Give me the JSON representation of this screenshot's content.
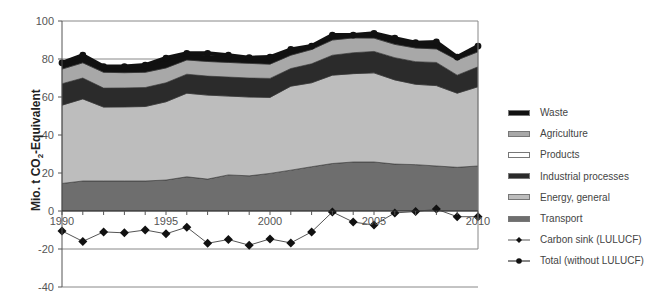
{
  "chart_data": {
    "type": "area",
    "title": "",
    "xlabel": "",
    "ylabel": "Mio. t CO2-Equivalent",
    "ylim": [
      -40,
      100
    ],
    "yticks": [
      -40,
      -20,
      0,
      20,
      40,
      60,
      80,
      100
    ],
    "xticks_labeled": [
      "1990",
      "1995",
      "2000",
      "2005",
      "2010"
    ],
    "x": [
      1990,
      1991,
      1992,
      1993,
      1994,
      1995,
      1996,
      1997,
      1998,
      1999,
      2000,
      2001,
      2002,
      2003,
      2004,
      2005,
      2006,
      2007,
      2008,
      2009,
      2010
    ],
    "grid": "horizontal lines at 80 and -20",
    "legend_position": "right",
    "stacked_series": [
      {
        "name": "Transport",
        "color": "#6e6e6e",
        "values": [
          14.5,
          15.8,
          15.8,
          15.8,
          15.8,
          16.3,
          18.0,
          16.8,
          19.0,
          18.5,
          19.8,
          21.5,
          23.3,
          25.0,
          25.8,
          25.8,
          24.7,
          24.4,
          23.7,
          23.0,
          23.7
        ]
      },
      {
        "name": "Energy, general",
        "color": "#bdbdbd",
        "values": [
          41.2,
          43.2,
          38.9,
          39.0,
          39.2,
          41.2,
          44.0,
          44.2,
          41.5,
          41.5,
          40.0,
          44.2,
          44.2,
          46.5,
          46.5,
          46.9,
          44.3,
          42.3,
          42.3,
          39.0,
          41.7
        ]
      },
      {
        "name": "Industrial processes",
        "color": "#2b2b2b",
        "values": [
          11.3,
          11.0,
          10.0,
          10.0,
          10.0,
          10.0,
          10.0,
          10.0,
          10.0,
          10.0,
          10.0,
          9.3,
          10.0,
          10.5,
          11.0,
          11.3,
          11.7,
          11.9,
          12.2,
          9.5,
          10.5
        ]
      },
      {
        "name": "Products",
        "color": "#ffffff",
        "values": [
          0,
          0,
          0,
          0,
          0,
          0,
          0,
          0,
          0,
          0,
          0,
          0,
          0,
          0,
          0,
          0,
          0,
          0,
          0,
          0,
          0
        ]
      },
      {
        "name": "Agriculture",
        "color": "#a8a8a8",
        "values": [
          7.7,
          8.0,
          8.3,
          8.0,
          8.0,
          7.8,
          7.5,
          7.7,
          7.7,
          7.7,
          7.5,
          7.0,
          7.5,
          8.0,
          7.8,
          7.0,
          7.0,
          7.2,
          7.1,
          8.0,
          7.9
        ]
      },
      {
        "name": "Waste",
        "color": "#111111",
        "values": [
          3.3,
          4.0,
          3.0,
          3.2,
          3.8,
          5.2,
          3.5,
          3.3,
          3.8,
          3.0,
          3.7,
          3.0,
          1.8,
          2.6,
          1.5,
          2.5,
          3.3,
          2.8,
          3.7,
          1.5,
          3.0
        ]
      }
    ],
    "line_series": [
      {
        "name": "Carbon sink (LULUCF)",
        "marker": "diamond",
        "color": "#555555",
        "values": [
          -10.5,
          -16.0,
          -11.0,
          -11.5,
          -10.0,
          -12.0,
          -8.5,
          -17.0,
          -15.0,
          -18.0,
          -14.7,
          -16.8,
          -11.0,
          -0.5,
          -5.8,
          -7.4,
          -1.0,
          -0.3,
          1.0,
          -3.0,
          -3.0
        ]
      },
      {
        "name": "Total (without LULUCF)",
        "marker": "circle",
        "color": "#111111",
        "values": [
          78.0,
          82.0,
          76.0,
          76.0,
          76.8,
          80.5,
          83.0,
          83.0,
          82.0,
          80.7,
          81.0,
          85.0,
          86.8,
          92.6,
          92.6,
          93.5,
          91.0,
          88.6,
          89.0,
          81.0,
          86.8
        ]
      }
    ]
  },
  "axis": {
    "ylabel_main": "Mio. t CO",
    "ylabel_sub": "2",
    "ylabel_tail": "-Equivalent"
  },
  "legend": {
    "items": [
      {
        "label": "Waste",
        "kind": "swatch",
        "color": "#111111"
      },
      {
        "label": "Agriculture",
        "kind": "swatch",
        "color": "#a8a8a8"
      },
      {
        "label": "Products",
        "kind": "swatch",
        "color": "#ffffff"
      },
      {
        "label": "Industrial processes",
        "kind": "swatch",
        "color": "#2b2b2b"
      },
      {
        "label": "Energy, general",
        "kind": "swatch",
        "color": "#bdbdbd"
      },
      {
        "label": "Transport",
        "kind": "swatch",
        "color": "#6e6e6e"
      },
      {
        "label": "Carbon sink (LULUCF)",
        "kind": "line-diamond",
        "color": "#555555"
      },
      {
        "label": "Total (without LULUCF)",
        "kind": "line-circle",
        "color": "#111111"
      }
    ]
  }
}
